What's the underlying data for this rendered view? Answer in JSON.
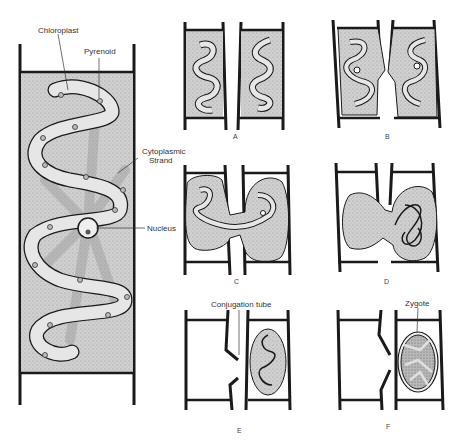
{
  "figure": {
    "main_cell": {
      "labels": {
        "chloroplast": "Chloroplast",
        "pyrenoid": "Pyrenoid",
        "cytoplasmic_strand": "Cytoplasmic\nStrand",
        "cytoplasmic_strand_line1": "Cytoplasmic",
        "cytoplasmic_strand_line2": "Strand",
        "nucleus": "Nucleus"
      }
    },
    "panels": [
      {
        "id": "A",
        "label": "A"
      },
      {
        "id": "B",
        "label": "B"
      },
      {
        "id": "C",
        "label": "C"
      },
      {
        "id": "D",
        "label": "D"
      },
      {
        "id": "E",
        "label": "E",
        "annotation": "Conjugation tube"
      },
      {
        "id": "F",
        "label": "F",
        "annotation": "Zygote"
      }
    ],
    "colors": {
      "outline": "#1a1a1a",
      "cytoplasm": "#c9c9c9",
      "chloroplast": "#e6e6e6",
      "background": "#ffffff"
    }
  }
}
